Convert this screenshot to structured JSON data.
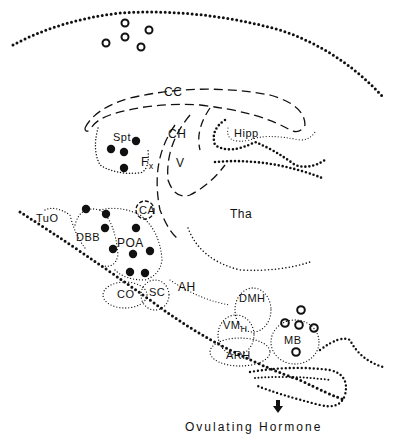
{
  "diagram": {
    "type": "sagittal brain section",
    "caption": "Ovulating Hormone",
    "legend_markers": {
      "filled_circle": "#111111",
      "open_circle": "#111111"
    },
    "labels": {
      "cc": "CC",
      "spt": "Spt",
      "ch": "CH",
      "hipp": "Hipp",
      "fx": "F",
      "fx_sub": "x",
      "v": "V",
      "tha": "Tha",
      "tuo": "TuO",
      "ca": "CA",
      "dbb": "DBB",
      "poa": "POA",
      "co": "CO",
      "sc": "SC",
      "ah": "AH",
      "dmh": "DMH",
      "vmh": "VM",
      "vmh_sub": "H",
      "arh": "ARH",
      "mb": "MB"
    }
  }
}
